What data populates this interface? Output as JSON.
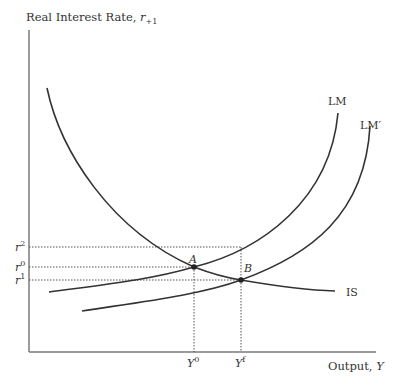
{
  "diagram": {
    "type": "IS-LM",
    "y_axis_label": "Real Interest Rate,",
    "y_axis_symbol": "r",
    "y_axis_subscript": "+1",
    "x_axis_label": "Output,",
    "x_axis_symbol": "Y",
    "curves": {
      "lm": "LM",
      "lm_prime": "LM′",
      "is": "IS"
    },
    "points": {
      "a": "A",
      "b": "B"
    },
    "y_ticks": [
      {
        "base": "r",
        "sup": "2"
      },
      {
        "base": "r",
        "sup": "0"
      },
      {
        "base": "r",
        "sup": "1"
      }
    ],
    "x_ticks": [
      {
        "base": "Y",
        "sup": "0"
      },
      {
        "base": "Y",
        "sup": "f"
      }
    ],
    "colors": {
      "axis": "#7a7a7a",
      "curve": "#333333",
      "guide": "#555555"
    }
  }
}
